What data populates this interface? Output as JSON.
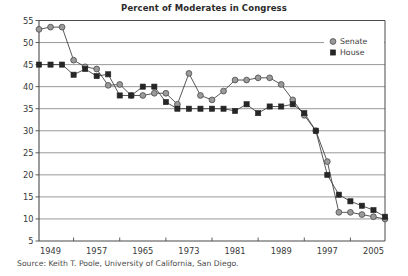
{
  "chart_data": {
    "type": "line",
    "title": "Percent of Moderates in Congress",
    "xlabel": "",
    "ylabel": "",
    "ylim": [
      5,
      55
    ],
    "ytick_step": 5,
    "yticks": [
      5,
      10,
      15,
      20,
      25,
      30,
      35,
      40,
      45,
      50,
      55
    ],
    "xlim": [
      1947,
      2007
    ],
    "xticks": [
      1949,
      1957,
      1965,
      1973,
      1981,
      1989,
      1997,
      2005
    ],
    "xtick_labels": [
      "1949",
      "1957",
      "1965",
      "1973",
      "1981",
      "1989",
      "1997",
      "2005"
    ],
    "x": [
      1947,
      1949,
      1951,
      1953,
      1955,
      1957,
      1959,
      1961,
      1963,
      1965,
      1967,
      1969,
      1971,
      1973,
      1975,
      1977,
      1979,
      1981,
      1983,
      1985,
      1987,
      1989,
      1991,
      1993,
      1995,
      1997,
      1999,
      2001,
      2003,
      2005,
      2007
    ],
    "grid": true,
    "grid_axis": "y",
    "legend_position": "top-right-inside",
    "series": [
      {
        "name": "Senate",
        "marker": "circle",
        "color": "#9a9a9a",
        "edge_color": "#4a4a4a",
        "values": [
          53,
          53.5,
          53.5,
          46,
          44.5,
          44,
          40.3,
          40.5,
          38,
          38,
          38.5,
          38.5,
          36,
          43,
          38,
          37,
          39,
          41.5,
          41.5,
          42,
          42,
          40.5,
          37,
          33.5,
          30,
          23,
          11.5,
          11.5,
          11,
          10.5,
          10
        ]
      },
      {
        "name": "House",
        "marker": "square",
        "color": "#262626",
        "edge_color": "#262626",
        "values": [
          45,
          45,
          45,
          42.7,
          44,
          42.4,
          42.8,
          38,
          38,
          40,
          40,
          36.5,
          35,
          35,
          35,
          35,
          35,
          34.5,
          36,
          34,
          35.5,
          35.5,
          36,
          34,
          30,
          20,
          15.5,
          14,
          13,
          12,
          10.5
        ]
      }
    ]
  },
  "legend": {
    "items": [
      {
        "label": "Senate",
        "marker": "circle"
      },
      {
        "label": "House",
        "marker": "square"
      }
    ]
  },
  "source": {
    "text": "Source: Keith T. Poole, University of California, San Diego."
  }
}
